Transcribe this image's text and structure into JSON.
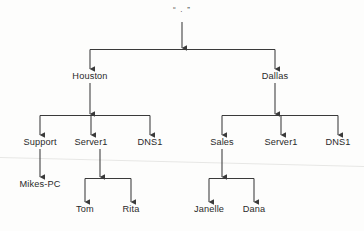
{
  "diagram": {
    "type": "hierarchy-tree",
    "title": "",
    "background_color": "#fdfdfc",
    "line_color": "#3a3a3a",
    "text_color": "#2a2a2a",
    "artifact_line_color": "#e7e7e5",
    "nodes": [
      {
        "id": "root",
        "label": "“ . ”",
        "x": 182,
        "y": 12,
        "level": 0
      },
      {
        "id": "houston",
        "label": "Houston",
        "x": 90,
        "y": 78,
        "level": 1
      },
      {
        "id": "dallas",
        "label": "Dallas",
        "x": 275,
        "y": 78,
        "level": 1
      },
      {
        "id": "support",
        "label": "Support",
        "x": 40,
        "y": 144,
        "level": 2
      },
      {
        "id": "server1-h",
        "label": "Server1",
        "x": 91,
        "y": 144,
        "level": 2
      },
      {
        "id": "dns1-h",
        "label": "DNS1",
        "x": 150,
        "y": 144,
        "level": 2
      },
      {
        "id": "sales",
        "label": "Sales",
        "x": 222,
        "y": 144,
        "level": 2
      },
      {
        "id": "server1-d",
        "label": "Server1",
        "x": 281,
        "y": 144,
        "level": 2
      },
      {
        "id": "dns1-d",
        "label": "DNS1",
        "x": 338,
        "y": 144,
        "level": 2
      },
      {
        "id": "mikes-pc",
        "label": "Mikes-PC",
        "x": 40,
        "y": 186,
        "level": 3
      },
      {
        "id": "tom",
        "label": "Tom",
        "x": 85,
        "y": 211,
        "level": 3
      },
      {
        "id": "rita",
        "label": "Rita",
        "x": 131,
        "y": 211,
        "level": 3
      },
      {
        "id": "janelle",
        "label": "Janelle",
        "x": 209,
        "y": 211,
        "level": 3
      },
      {
        "id": "dana",
        "label": "Dana",
        "x": 254,
        "y": 211,
        "level": 3
      }
    ],
    "edges": [
      {
        "from": "root",
        "to": "houston"
      },
      {
        "from": "root",
        "to": "dallas"
      },
      {
        "from": "houston",
        "to": "support"
      },
      {
        "from": "houston",
        "to": "server1-h"
      },
      {
        "from": "houston",
        "to": "dns1-h"
      },
      {
        "from": "dallas",
        "to": "sales"
      },
      {
        "from": "dallas",
        "to": "server1-d"
      },
      {
        "from": "dallas",
        "to": "dns1-d"
      },
      {
        "from": "support",
        "to": "mikes-pc"
      },
      {
        "from": "server1-h",
        "to": "tom"
      },
      {
        "from": "server1-h",
        "to": "rita"
      },
      {
        "from": "sales",
        "to": "janelle"
      },
      {
        "from": "sales",
        "to": "dana"
      }
    ]
  }
}
